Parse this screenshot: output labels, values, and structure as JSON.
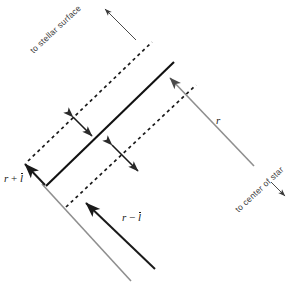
{
  "figure": {
    "background_color": "#ffffff",
    "width": 299,
    "height": 292,
    "colors": {
      "solid_line": "#111111",
      "dashed_line": "#1a1a1a",
      "gray_line": "#8a8a8a",
      "arrow_black": "#1a1a1a",
      "label_text": "#3a3a3a",
      "math_text": "#1a1a1a"
    },
    "labels": {
      "stellar_surface": "to stellar surface",
      "center_of_star": "to center of star",
      "r": "r",
      "r_plus_lbar_prefix": "r",
      "r_plus_lbar_op": " + ",
      "r_plus_lbar_var": "l",
      "r_minus_lbar_prefix": "r",
      "r_minus_lbar_op": " − ",
      "r_minus_lbar_var": "l"
    },
    "elements": {
      "solid_ray": "central solid black line inclined about -43 degrees",
      "dashed_upper": "dashed line parallel above the solid ray",
      "dashed_lower": "dashed line parallel below the solid ray",
      "double_arrow_upper": "double headed arrow perpendicular between dashed upper and solid ray",
      "double_arrow_lower": "double headed arrow perpendicular between solid ray and dashed lower",
      "gray_radius_arrow": "gray arrow labelled r pointing up-left to the solid ray",
      "gray_outward_line": "gray line running to lower right toward center of star",
      "gray_left_line": "gray line from vertex toward lower right",
      "black_arrow_r_plus": "black arrow pointing up-left labelled r + l-bar",
      "black_arrow_r_minus": "black arrow pointing up-left labelled r - l-bar",
      "stellar_surface_arrow": "thin arrow pointing up-left near to stellar surface label",
      "center_of_star_arrow": "short thin arrow pointing down-right near to center of star label"
    }
  }
}
